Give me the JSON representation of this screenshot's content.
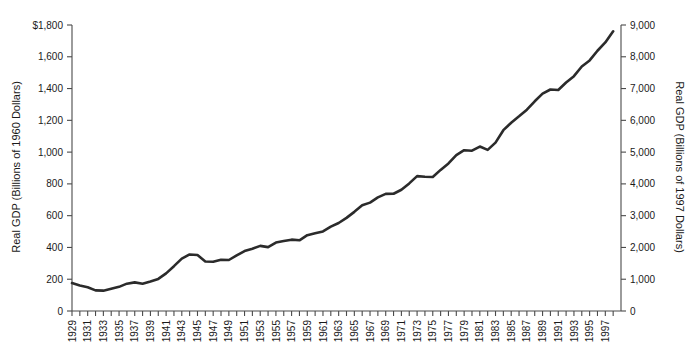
{
  "chart_data": {
    "type": "line",
    "title": "",
    "subtitle": "",
    "xlabel": "",
    "ylabel": "Real GDP (Billions of 1960 Dollars)",
    "ylabel_right": "Real GDP (Billions of 1997 Dollars)",
    "grid": false,
    "legend": "none",
    "ylim": [
      0,
      1800
    ],
    "ylim_right": [
      0,
      9000
    ],
    "xlim": [
      1929,
      1999
    ],
    "y_ticks": [
      "0",
      "200",
      "400",
      "600",
      "800",
      "1,000",
      "1,200",
      "1,400",
      "1,600",
      "$1,800"
    ],
    "y_tick_values": [
      0,
      200,
      400,
      600,
      800,
      1000,
      1200,
      1400,
      1600,
      1800
    ],
    "y_ticks_right": [
      "0",
      "1,000",
      "2,000",
      "3,000",
      "4,000",
      "5,000",
      "6,000",
      "7,000",
      "8,000",
      "9,000"
    ],
    "y_tick_values_right": [
      0,
      1000,
      2000,
      3000,
      4000,
      5000,
      6000,
      7000,
      8000,
      9000
    ],
    "x_tick_labels": [
      "1929",
      "1931",
      "1933",
      "1935",
      "1937",
      "1939",
      "1941",
      "1943",
      "1945",
      "1947",
      "1949",
      "1951",
      "1953",
      "1955",
      "1957",
      "1959",
      "1961",
      "1963",
      "1965",
      "1967",
      "1969",
      "1971",
      "1973",
      "1975",
      "1977",
      "1979",
      "1981",
      "1983",
      "1985",
      "1987",
      "1989",
      "1991",
      "1993",
      "1995",
      "1997"
    ],
    "x": [
      1929,
      1930,
      1931,
      1932,
      1933,
      1934,
      1935,
      1936,
      1937,
      1938,
      1939,
      1940,
      1941,
      1942,
      1943,
      1944,
      1945,
      1946,
      1947,
      1948,
      1949,
      1950,
      1951,
      1952,
      1953,
      1954,
      1955,
      1956,
      1957,
      1958,
      1959,
      1960,
      1961,
      1962,
      1963,
      1964,
      1965,
      1966,
      1967,
      1968,
      1969,
      1970,
      1971,
      1972,
      1973,
      1974,
      1975,
      1976,
      1977,
      1978,
      1979,
      1980,
      1981,
      1982,
      1983,
      1984,
      1985,
      1986,
      1987,
      1988,
      1989,
      1990,
      1991,
      1992,
      1993,
      1994,
      1995,
      1996,
      1997,
      1998
    ],
    "series": [
      {
        "name": "Real GDP",
        "color": "#2b2b2b",
        "values": [
          176,
          160,
          150,
          130,
          128,
          140,
          152,
          172,
          180,
          172,
          186,
          202,
          237,
          282,
          330,
          356,
          352,
          312,
          310,
          323,
          321,
          350,
          377,
          392,
          410,
          402,
          431,
          440,
          449,
          445,
          477,
          489,
          501,
          531,
          554,
          586,
          624,
          665,
          682,
          715,
          737,
          738,
          763,
          803,
          849,
          845,
          843,
          888,
          929,
          981,
          1012,
          1009,
          1035,
          1014,
          1060,
          1138,
          1185,
          1225,
          1267,
          1320,
          1368,
          1394,
          1391,
          1438,
          1478,
          1539,
          1577,
          1638,
          1690,
          1760
        ]
      }
    ]
  },
  "axes": {
    "left_title": "Real GDP (Billions of 1960 Dollars)",
    "right_title": "Real GDP (Billions of 1997 Dollars)"
  }
}
